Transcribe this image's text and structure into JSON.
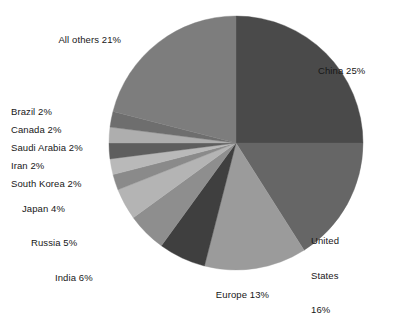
{
  "chart_data": {
    "type": "pie",
    "title": "",
    "subtitle": "",
    "xlabel": "",
    "ylabel": "",
    "legend_position": "none",
    "grid": false,
    "units": "percent",
    "start_angle_deg": 0,
    "direction": "clockwise",
    "categories": [
      "China",
      "United States",
      "Europe",
      "India",
      "Russia",
      "Japan",
      "South Korea",
      "Iran",
      "Saudi Arabia",
      "Canada",
      "Brazil",
      "All others"
    ],
    "values": [
      25,
      16,
      13,
      6,
      5,
      4,
      2,
      2,
      2,
      2,
      2,
      21
    ],
    "slices": [
      {
        "name": "China",
        "value": 25,
        "label": "China 25%",
        "label_lines": [
          "China 25%"
        ],
        "color": "#4a4a4a",
        "label_position": "right"
      },
      {
        "name": "United States",
        "value": 16,
        "label": "United States 16%",
        "label_lines": [
          "United",
          "States",
          "16%"
        ],
        "color": "#666666",
        "label_position": "right"
      },
      {
        "name": "Europe",
        "value": 13,
        "label": "Europe 13%",
        "label_lines": [
          "Europe 13%"
        ],
        "color": "#9b9b9b",
        "label_position": "bottom"
      },
      {
        "name": "India",
        "value": 6,
        "label": "India 6%",
        "label_lines": [
          "India 6%"
        ],
        "color": "#3f3f3f",
        "label_position": "bottom-left"
      },
      {
        "name": "Russia",
        "value": 5,
        "label": "Russia 5%",
        "label_lines": [
          "Russia 5%"
        ],
        "color": "#8e8e8e",
        "label_position": "left"
      },
      {
        "name": "Japan",
        "value": 4,
        "label": "Japan 4%",
        "label_lines": [
          "Japan 4%"
        ],
        "color": "#b4b4b4",
        "label_position": "left"
      },
      {
        "name": "South Korea",
        "value": 2,
        "label": "South Korea 2%",
        "label_lines": [
          "South Korea 2%"
        ],
        "color": "#8a8a8a",
        "label_position": "left"
      },
      {
        "name": "Iran",
        "value": 2,
        "label": "Iran 2%",
        "label_lines": [
          "Iran 2%"
        ],
        "color": "#b9b9b9",
        "label_position": "left"
      },
      {
        "name": "Saudi Arabia",
        "value": 2,
        "label": "Saudi Arabia 2%",
        "label_lines": [
          "Saudi Arabia 2%"
        ],
        "color": "#5e5e5e",
        "label_position": "left"
      },
      {
        "name": "Canada",
        "value": 2,
        "label": "Canada 2%",
        "label_lines": [
          "Canada 2%"
        ],
        "color": "#aeaeae",
        "label_position": "left"
      },
      {
        "name": "Brazil",
        "value": 2,
        "label": "Brazil 2%",
        "label_lines": [
          "Brazil 2%"
        ],
        "color": "#6e6e6e",
        "label_position": "left"
      },
      {
        "name": "All others",
        "value": 21,
        "label": "All others 21%",
        "label_lines": [
          "All others 21%"
        ],
        "color": "#7d7d7d",
        "label_position": "top-left"
      }
    ]
  },
  "labels": {
    "china": "China 25%",
    "united_states_line1": "United",
    "united_states_line2": "States",
    "united_states_line3": "16%",
    "europe": "Europe 13%",
    "india": "India 6%",
    "russia": "Russia 5%",
    "japan": "Japan 4%",
    "south_korea": "South Korea 2%",
    "iran": "Iran 2%",
    "saudi_arabia": "Saudi Arabia 2%",
    "canada": "Canada 2%",
    "brazil": "Brazil 2%",
    "all_others": "All others 21%"
  },
  "geometry": {
    "center_x": 236,
    "center_y": 143,
    "radius": 127
  }
}
